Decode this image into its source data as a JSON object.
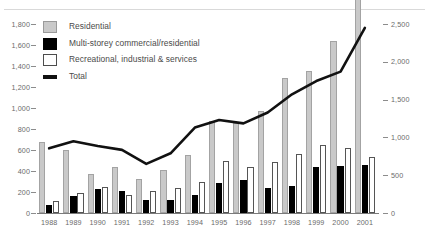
{
  "chart_data": {
    "type": "bar",
    "title": "",
    "subtitle": "",
    "xlabel": "",
    "ylabel": "",
    "grid": false,
    "legend_position": "top-left",
    "categories": [
      "1988",
      "1989",
      "1990",
      "1991",
      "1992",
      "1993",
      "1994",
      "1995",
      "1996",
      "1997",
      "1998",
      "1999",
      "2000",
      "2001"
    ],
    "axes": {
      "left": {
        "label": "",
        "ylim": [
          0,
          1800
        ],
        "tick_step": 200,
        "ticks": [
          "0",
          "200",
          "400",
          "600",
          "800",
          "1,000",
          "1,200",
          "1,400",
          "1,600",
          "1,800"
        ],
        "applies_to": [
          "Residential",
          "Multi-storey commercial/residential",
          "Recreational, industrial & services"
        ]
      },
      "right": {
        "label": "",
        "ylim": [
          0,
          2500
        ],
        "tick_step": 500,
        "ticks": [
          "0",
          "500",
          "1,000",
          "1,500",
          "2,000",
          "2,500"
        ],
        "applies_to": [
          "Total"
        ]
      }
    },
    "series": [
      {
        "name": "Residential",
        "kind": "bar",
        "color": "#c9c9c9",
        "axis": "left",
        "values": [
          675,
          600,
          375,
          435,
          325,
          405,
          550,
          880,
          855,
          975,
          1290,
          1355,
          1640,
          2340
        ]
      },
      {
        "name": "Multi-storey commercial/residential",
        "kind": "bar",
        "color": "#000000",
        "axis": "left",
        "values": [
          80,
          165,
          230,
          210,
          125,
          125,
          175,
          290,
          310,
          235,
          255,
          440,
          450,
          455
        ]
      },
      {
        "name": "Recreational, industrial & services",
        "kind": "bar",
        "color": "#ffffff",
        "axis": "left",
        "values": [
          110,
          190,
          245,
          175,
          210,
          235,
          295,
          500,
          440,
          485,
          565,
          650,
          620,
          535
        ]
      },
      {
        "name": "Total",
        "kind": "line",
        "color": "#111111",
        "axis": "right",
        "values": [
          855,
          950,
          885,
          835,
          650,
          790,
          1130,
          1230,
          1185,
          1330,
          1570,
          1745,
          1870,
          2450
        ]
      }
    ]
  },
  "legend": {
    "items": [
      {
        "label": "Residential",
        "swatch": "residential-swatch"
      },
      {
        "label": "Multi-storey commercial/residential",
        "swatch": "multistorey-swatch"
      },
      {
        "label": "Recreational, industrial & services",
        "swatch": "recreational-swatch"
      },
      {
        "label": "Total",
        "swatch": "total-line-swatch"
      }
    ]
  }
}
